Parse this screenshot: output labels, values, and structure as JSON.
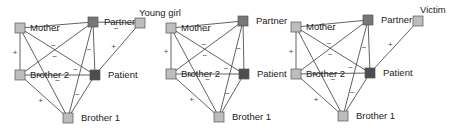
{
  "colors": {
    "node_default": "#bdbdbd",
    "node_partner": "#777777",
    "node_patient": "#4d4d4d",
    "edge": "#3a3a3a"
  },
  "panels": [
    {
      "id": "panel-1",
      "nodes": [
        {
          "id": "mother",
          "label": "Mother",
          "x": 20,
          "y": 28,
          "type": "default",
          "label_dx": 5,
          "label_dy": 3,
          "label_anchor": "start"
        },
        {
          "id": "partner",
          "label": "Partner",
          "x": 93,
          "y": 22,
          "type": "partner",
          "label_dx": 6,
          "label_dy": 3,
          "label_anchor": "start"
        },
        {
          "id": "young-girl",
          "label": "Young girl",
          "x": 140,
          "y": 23,
          "type": "default",
          "label_dx": -6,
          "label_dy": -7,
          "label_anchor": "start"
        },
        {
          "id": "brother-2",
          "label": "Brother 2",
          "x": 20,
          "y": 75,
          "type": "default",
          "label_dx": 5,
          "label_dy": 3,
          "label_anchor": "start"
        },
        {
          "id": "patient",
          "label": "Patient",
          "x": 95,
          "y": 75,
          "type": "patient",
          "label_dx": 8,
          "label_dy": 3,
          "label_anchor": "start"
        },
        {
          "id": "brother-1",
          "label": "Brother 1",
          "x": 68,
          "y": 118,
          "type": "default",
          "label_dx": 8,
          "label_dy": 3,
          "label_anchor": "start"
        }
      ],
      "edges": [
        {
          "from": "mother",
          "to": "partner",
          "sign": "−"
        },
        {
          "from": "partner",
          "to": "young-girl",
          "sign": "−"
        },
        {
          "from": "mother",
          "to": "brother-2",
          "sign": "+"
        },
        {
          "from": "mother",
          "to": "patient",
          "sign": "−"
        },
        {
          "from": "mother",
          "to": "brother-1",
          "sign": "+"
        },
        {
          "from": "partner",
          "to": "brother-2",
          "sign": "−"
        },
        {
          "from": "partner",
          "to": "patient",
          "sign": "−"
        },
        {
          "from": "partner",
          "to": "brother-1",
          "sign": "−"
        },
        {
          "from": "brother-2",
          "to": "patient",
          "sign": "−"
        },
        {
          "from": "brother-2",
          "to": "brother-1",
          "sign": "+"
        },
        {
          "from": "patient",
          "to": "brother-1",
          "sign": "−"
        },
        {
          "from": "young-girl",
          "to": "patient",
          "sign": "+"
        }
      ]
    },
    {
      "id": "panel-2",
      "nodes": [
        {
          "id": "mother",
          "label": "Mother",
          "x": 171,
          "y": 28,
          "type": "default",
          "label_dx": 5,
          "label_dy": 3,
          "label_anchor": "start"
        },
        {
          "id": "partner",
          "label": "Partner",
          "x": 243,
          "y": 21,
          "type": "partner",
          "label_dx": 8,
          "label_dy": 3,
          "label_anchor": "start"
        },
        {
          "id": "brother-2",
          "label": "Brother 2",
          "x": 171,
          "y": 74,
          "type": "default",
          "label_dx": 5,
          "label_dy": 3,
          "label_anchor": "start"
        },
        {
          "id": "patient",
          "label": "Patient",
          "x": 244,
          "y": 74,
          "type": "patient",
          "label_dx": 8,
          "label_dy": 3,
          "label_anchor": "start"
        },
        {
          "id": "brother-1",
          "label": "Brother 1",
          "x": 219,
          "y": 117,
          "type": "default",
          "label_dx": 8,
          "label_dy": 3,
          "label_anchor": "start"
        }
      ],
      "edges": [
        {
          "from": "mother",
          "to": "partner",
          "sign": "−"
        },
        {
          "from": "mother",
          "to": "brother-2",
          "sign": "+"
        },
        {
          "from": "mother",
          "to": "patient",
          "sign": "−"
        },
        {
          "from": "mother",
          "to": "brother-1",
          "sign": "+"
        },
        {
          "from": "partner",
          "to": "brother-2",
          "sign": "−"
        },
        {
          "from": "partner",
          "to": "patient",
          "sign": "−"
        },
        {
          "from": "partner",
          "to": "brother-1",
          "sign": "−"
        },
        {
          "from": "brother-2",
          "to": "patient",
          "sign": "−"
        },
        {
          "from": "brother-2",
          "to": "brother-1",
          "sign": "+"
        },
        {
          "from": "patient",
          "to": "brother-1",
          "sign": "−"
        }
      ]
    },
    {
      "id": "panel-3",
      "nodes": [
        {
          "id": "mother",
          "label": "Mother",
          "x": 296,
          "y": 27,
          "type": "default",
          "label_dx": 5,
          "label_dy": 3,
          "label_anchor": "start"
        },
        {
          "id": "partner",
          "label": "Partner",
          "x": 368,
          "y": 20,
          "type": "partner",
          "label_dx": 8,
          "label_dy": 3,
          "label_anchor": "start"
        },
        {
          "id": "victim",
          "label": "Victim",
          "x": 418,
          "y": 21,
          "type": "default",
          "label_dx": -3,
          "label_dy": -8,
          "label_anchor": "start"
        },
        {
          "id": "brother-2",
          "label": "Brother 2",
          "x": 296,
          "y": 74,
          "type": "default",
          "label_dx": 5,
          "label_dy": 3,
          "label_anchor": "start"
        },
        {
          "id": "patient",
          "label": "Patient",
          "x": 370,
          "y": 73,
          "type": "patient",
          "label_dx": 8,
          "label_dy": 3,
          "label_anchor": "start"
        },
        {
          "id": "brother-1",
          "label": "Brother 1",
          "x": 343,
          "y": 116,
          "type": "default",
          "label_dx": 8,
          "label_dy": 3,
          "label_anchor": "start"
        }
      ],
      "edges": [
        {
          "from": "mother",
          "to": "partner",
          "sign": "−"
        },
        {
          "from": "mother",
          "to": "brother-2",
          "sign": "+"
        },
        {
          "from": "mother",
          "to": "patient",
          "sign": "−"
        },
        {
          "from": "mother",
          "to": "brother-1",
          "sign": "+"
        },
        {
          "from": "partner",
          "to": "brother-2",
          "sign": "−"
        },
        {
          "from": "partner",
          "to": "patient",
          "sign": "−"
        },
        {
          "from": "partner",
          "to": "brother-1",
          "sign": "−"
        },
        {
          "from": "brother-2",
          "to": "patient",
          "sign": "−"
        },
        {
          "from": "brother-2",
          "to": "brother-1",
          "sign": "+"
        },
        {
          "from": "patient",
          "to": "brother-1",
          "sign": "−"
        },
        {
          "from": "victim",
          "to": "patient",
          "sign": "+"
        }
      ]
    }
  ]
}
